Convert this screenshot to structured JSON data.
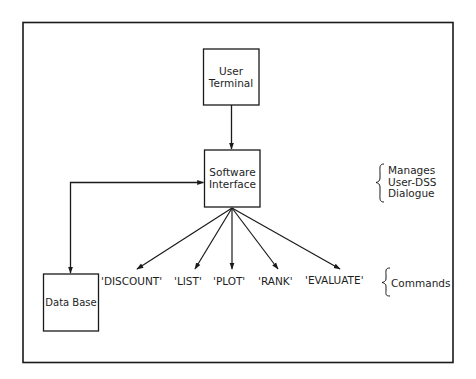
{
  "diagram": {
    "nodes": {
      "user_terminal": {
        "lines": [
          "User",
          "Terminal"
        ]
      },
      "software_interface": {
        "lines": [
          "Software",
          "Interface"
        ]
      },
      "data_base": {
        "label": "Data Base"
      }
    },
    "commands": [
      {
        "label": "'DISCOUNT'"
      },
      {
        "label": "'LIST'"
      },
      {
        "label": "'PLOT'"
      },
      {
        "label": "'RANK'"
      },
      {
        "label": "'EVALUATE'"
      }
    ],
    "annotations": {
      "interface_role": {
        "lines": [
          "Manages",
          "User-DSS",
          "Dialogue"
        ]
      },
      "commands_group": {
        "label": "Commands"
      }
    },
    "edges": [
      {
        "from": "User Terminal",
        "to": "Software Interface",
        "direction": "one-way"
      },
      {
        "from": "Software Interface",
        "to": "Data Base",
        "direction": "two-way"
      },
      {
        "from": "Software Interface",
        "to": "'DISCOUNT'",
        "direction": "one-way"
      },
      {
        "from": "Software Interface",
        "to": "'LIST'",
        "direction": "one-way"
      },
      {
        "from": "Software Interface",
        "to": "'PLOT'",
        "direction": "one-way"
      },
      {
        "from": "Software Interface",
        "to": "'RANK'",
        "direction": "one-way"
      },
      {
        "from": "Software Interface",
        "to": "'EVALUATE'",
        "direction": "one-way"
      }
    ],
    "colors": {
      "line": "#1a1a1a",
      "background": "#ffffff"
    }
  }
}
